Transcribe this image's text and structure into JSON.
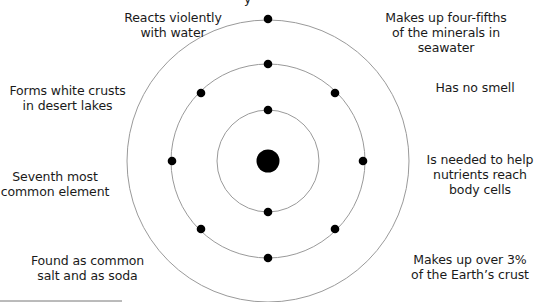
{
  "diagram": {
    "type": "atomic-structure",
    "shells": [
      {
        "name": "inner",
        "electrons": 2
      },
      {
        "name": "middle",
        "electrons": 8
      },
      {
        "name": "outer",
        "electrons": 1
      }
    ],
    "colors": {
      "ring": "#9a9a9a",
      "electron": "#000000",
      "nucleus": "#000000"
    }
  },
  "labels": {
    "top_partial": "y",
    "reacts": [
      "Reacts violently",
      "with water"
    ],
    "fourfifths": [
      "Makes up four-fifths",
      "of the minerals in",
      "seawater"
    ],
    "crusts": [
      "Forms white crusts",
      "in desert lakes"
    ],
    "smell": [
      "Has no smell"
    ],
    "seventh": [
      "Seventh most",
      "common element"
    ],
    "nutrients": [
      "Is needed to help",
      "nutrients reach",
      "body cells"
    ],
    "salt": [
      "Found as common",
      "salt and as soda"
    ],
    "crust3": [
      "Makes up over 3%",
      "of the Earth’s crust"
    ]
  }
}
